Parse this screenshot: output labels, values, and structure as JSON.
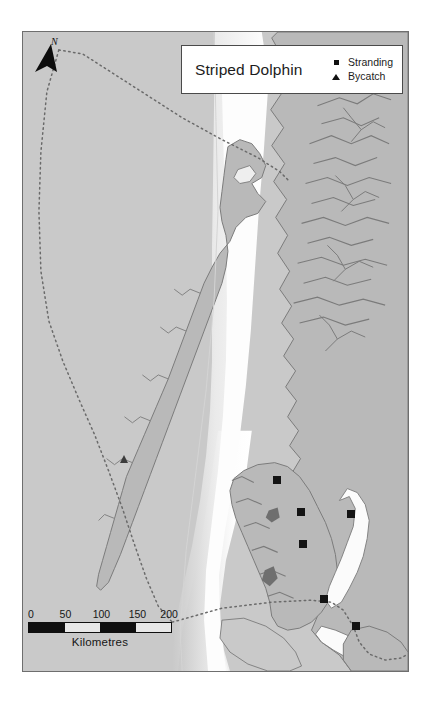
{
  "figure": {
    "kind": "species-distribution-map",
    "background_color": "#ffffff"
  },
  "legend": {
    "title": "Striped Dolphin",
    "entries": [
      {
        "label": "Stranding",
        "symbol": "square",
        "color": "#111111"
      },
      {
        "label": "Bycatch",
        "symbol": "triangle",
        "color": "#111111"
      }
    ]
  },
  "north_arrow": {
    "label": "N",
    "icon": "north-arrow-icon"
  },
  "scale_bar": {
    "ticks": [
      "0",
      "50",
      "100",
      "150",
      "200"
    ],
    "units_label": "Kilometres",
    "segment_fills": [
      "dark",
      "light",
      "dark",
      "light"
    ]
  },
  "map": {
    "ocean_color": "#c9c9c9",
    "shelf_color": "#fdfdfd",
    "land_color": "#b9b9b9",
    "coastline_color": "#7b7b7b",
    "boundary_color": "#6a6a6a",
    "boundary_style": "dotted",
    "frame_color": "#6e6e6e"
  },
  "observations": {
    "stranding_count": 6,
    "bycatch_count": 1,
    "strandings": [
      {
        "x": 276,
        "y": 479
      },
      {
        "x": 300,
        "y": 511
      },
      {
        "x": 350,
        "y": 513
      },
      {
        "x": 302,
        "y": 543
      },
      {
        "x": 323,
        "y": 598
      },
      {
        "x": 355,
        "y": 625
      }
    ],
    "bycatch": [
      {
        "x": 123,
        "y": 458
      }
    ]
  }
}
